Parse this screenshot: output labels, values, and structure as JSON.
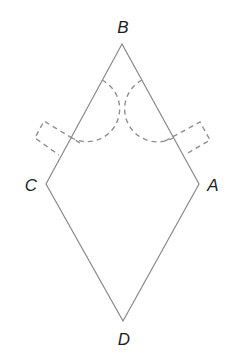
{
  "diagram": {
    "type": "rhombus with dashed construction arcs and rectangles",
    "colors": {
      "edge": "#8a8a8a",
      "dashed": "#8f8f8f",
      "label": "#1e1e1e",
      "background": "#ffffff"
    },
    "vertices": [
      {
        "id": "B",
        "label": "B",
        "x": 122,
        "y": 44
      },
      {
        "id": "C",
        "label": "C",
        "x": 46,
        "y": 184
      },
      {
        "id": "A",
        "label": "A",
        "x": 199,
        "y": 184
      },
      {
        "id": "D",
        "label": "D",
        "x": 123,
        "y": 321
      }
    ],
    "edges": [
      [
        "B",
        "C"
      ],
      [
        "C",
        "D"
      ],
      [
        "D",
        "A"
      ],
      [
        "A",
        "B"
      ]
    ],
    "dashed_elements": [
      {
        "name": "left-arc",
        "on_edge": "BC"
      },
      {
        "name": "right-arc",
        "on_edge": "BA"
      },
      {
        "name": "left-rectangle",
        "on_edge": "BC"
      },
      {
        "name": "right-rectangle",
        "on_edge": "BA"
      }
    ]
  }
}
